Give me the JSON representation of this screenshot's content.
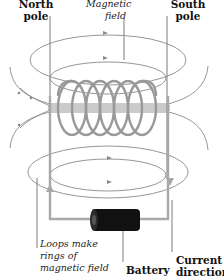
{
  "labels": {
    "north_pole": [
      "North",
      "pole"
    ],
    "magnetic_field": [
      "Magnetic",
      "field"
    ],
    "south_pole": [
      "South",
      "pole"
    ],
    "loops": [
      "Loops make",
      "rings of",
      "magnetic field"
    ],
    "battery": "Battery",
    "current_direction": [
      "Current",
      "direction"
    ]
  },
  "colors": {
    "field_line": "#8a8a8a",
    "coil": "#999999",
    "wire": "#a8a8a8",
    "battery": "#111111",
    "leader": "#444444",
    "text": "#111111"
  },
  "coil": {
    "turns": 6
  }
}
